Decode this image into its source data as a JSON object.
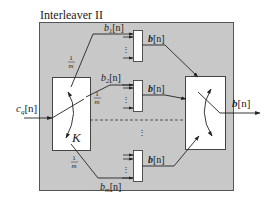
{
  "diagram": {
    "title": "Interleaver II",
    "input": {
      "label": "c_q[n]",
      "base": "c",
      "sub": "q",
      "arg": "[n]"
    },
    "output": {
      "label": "b[n]",
      "base": "b",
      "arg": "[n]"
    },
    "left_switch": {
      "label": "K"
    },
    "branches": [
      {
        "label": "b_1[n]",
        "base": "b",
        "sub": "1",
        "arg": "[n]",
        "rate": "1/m",
        "rate_num": "1",
        "rate_den": "m",
        "out_label": "b[n]"
      },
      {
        "label": "b_2[n]",
        "base": "b",
        "sub": "2",
        "arg": "[n]",
        "rate": "1/m",
        "rate_num": "1",
        "rate_den": "m",
        "out_label": "b[n]"
      },
      {
        "label": "b_m[n]",
        "base": "b",
        "sub": "m",
        "arg": "[n]",
        "rate": "1/m",
        "rate_num": "1",
        "rate_den": "m",
        "out_label": "b[n]"
      }
    ],
    "ellipsis": "⋮",
    "colors": {
      "background": "#ffffff",
      "outer_box_fill": "#c8c8c8",
      "outer_box_stroke": "#555555",
      "block_fill": "#ffffff",
      "line": "#222222"
    }
  }
}
